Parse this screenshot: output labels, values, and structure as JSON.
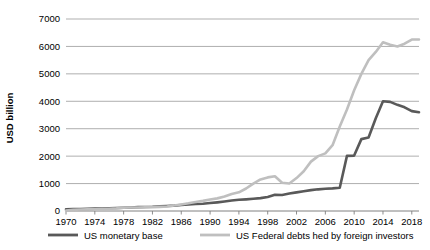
{
  "chart_data": {
    "type": "line",
    "title": "",
    "xlabel": "",
    "ylabel": "USD billion",
    "xlim": [
      1970,
      2019
    ],
    "ylim": [
      0,
      7000
    ],
    "grid": true,
    "legend_position": "bottom",
    "xtick_labels": [
      "1970",
      "1974",
      "1978",
      "1982",
      "1986",
      "1990",
      "1994",
      "1998",
      "2002",
      "2006",
      "2010",
      "2014",
      "2018"
    ],
    "ytick_labels": [
      "0",
      "1000",
      "2000",
      "3000",
      "4000",
      "5000",
      "6000",
      "7000"
    ],
    "ytick_values": [
      0,
      1000,
      2000,
      3000,
      4000,
      5000,
      6000,
      7000
    ],
    "x": [
      1970,
      1971,
      1972,
      1973,
      1974,
      1975,
      1976,
      1977,
      1978,
      1979,
      1980,
      1981,
      1982,
      1983,
      1984,
      1985,
      1986,
      1987,
      1988,
      1989,
      1990,
      1991,
      1992,
      1993,
      1994,
      1995,
      1996,
      1997,
      1998,
      1999,
      2000,
      2001,
      2002,
      2003,
      2004,
      2005,
      2006,
      2007,
      2008,
      2009,
      2010,
      2011,
      2012,
      2013,
      2014,
      2015,
      2016,
      2017,
      2018,
      2019
    ],
    "series": [
      {
        "name": "US monetary base",
        "color": "#595959",
        "values": [
          62,
          67,
          72,
          79,
          86,
          92,
          99,
          108,
          118,
          128,
          140,
          146,
          156,
          172,
          181,
          195,
          220,
          240,
          255,
          265,
          290,
          315,
          345,
          380,
          410,
          425,
          445,
          470,
          510,
          590,
          585,
          635,
          680,
          720,
          760,
          790,
          810,
          825,
          850,
          2010,
          2020,
          2620,
          2680,
          3380,
          4000,
          3980,
          3870,
          3780,
          3640,
          3600
        ]
      },
      {
        "name": "US Federal debts hed by foreign investors",
        "color": "#bfbfbf",
        "values": [
          20,
          40,
          55,
          60,
          65,
          70,
          80,
          95,
          120,
          125,
          130,
          135,
          140,
          150,
          165,
          200,
          240,
          280,
          330,
          370,
          420,
          460,
          530,
          620,
          680,
          820,
          1000,
          1150,
          1225,
          1265,
          1030,
          1000,
          1200,
          1450,
          1800,
          2000,
          2100,
          2400,
          3080,
          3700,
          4400,
          5000,
          5500,
          5800,
          6150,
          6060,
          6000,
          6100,
          6250,
          6250
        ]
      }
    ],
    "annotations": []
  },
  "legend": {
    "items": [
      {
        "label": "US monetary base",
        "color": "#595959"
      },
      {
        "label": "US Federal debts hed by foreign investors",
        "color": "#bfbfbf"
      }
    ]
  },
  "axis": {
    "y_title": "USD billion"
  }
}
